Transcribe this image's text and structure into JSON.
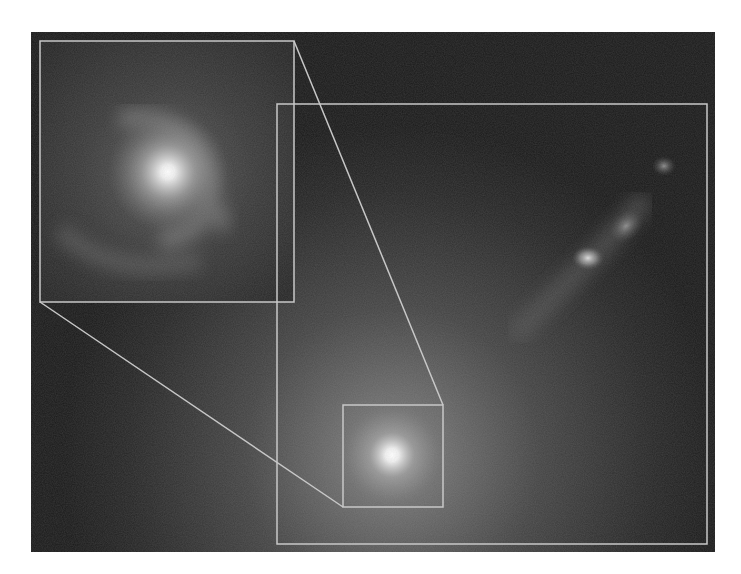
{
  "figure": {
    "background": "#141414",
    "outline_color": "#c8c8c8",
    "main_region": {
      "x": 277,
      "y": 104,
      "w": 430,
      "h": 440
    },
    "inset_region": {
      "x": 40,
      "y": 41,
      "w": 254,
      "h": 261
    },
    "zoom_source_box": {
      "x": 343,
      "y": 405,
      "w": 100,
      "h": 102
    },
    "features": [
      {
        "name": "galaxy-nucleus",
        "x": 392,
        "y": 455
      },
      {
        "name": "jet-knot-bright",
        "x": 588,
        "y": 260
      },
      {
        "name": "jet-knot-middle",
        "x": 628,
        "y": 222
      },
      {
        "name": "jet-knot-outer",
        "x": 664,
        "y": 168
      }
    ]
  }
}
